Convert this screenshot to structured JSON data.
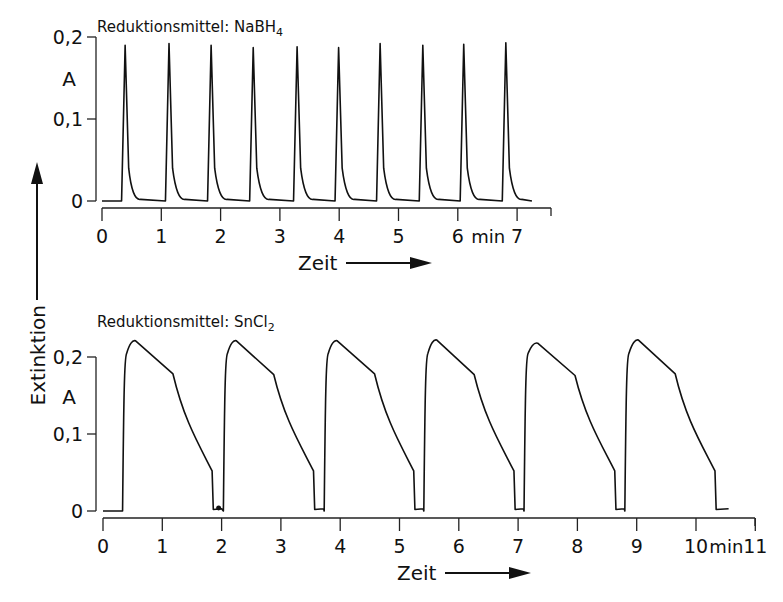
{
  "y_axis_shared_label": "Extinktion",
  "chart_data": [
    {
      "type": "line",
      "title": "Reduktionsmittel: NaBH",
      "title_subscript": "4",
      "xlabel": "Zeit",
      "x_unit": "min",
      "ylabel": "A",
      "x_ticks": [
        "0",
        "1",
        "2",
        "3",
        "4",
        "5",
        "6",
        "7"
      ],
      "y_ticks": [
        "0",
        "0,1",
        "0,2"
      ],
      "xlim": [
        0,
        7.3
      ],
      "ylim": [
        0,
        0.2
      ],
      "grid": false,
      "legend": null,
      "peak_shape": "sharp",
      "peaks": [
        {
          "t_start": 0.33,
          "t_peak": 0.39,
          "t_end": 0.55,
          "height": 0.19
        },
        {
          "t_start": 1.07,
          "t_peak": 1.13,
          "t_end": 1.3,
          "height": 0.192
        },
        {
          "t_start": 1.78,
          "t_peak": 1.84,
          "t_end": 2.01,
          "height": 0.19
        },
        {
          "t_start": 2.49,
          "t_peak": 2.55,
          "t_end": 2.72,
          "height": 0.187
        },
        {
          "t_start": 3.23,
          "t_peak": 3.29,
          "t_end": 3.46,
          "height": 0.188
        },
        {
          "t_start": 3.93,
          "t_peak": 3.99,
          "t_end": 4.16,
          "height": 0.187
        },
        {
          "t_start": 4.63,
          "t_peak": 4.69,
          "t_end": 4.86,
          "height": 0.192
        },
        {
          "t_start": 5.35,
          "t_peak": 5.41,
          "t_end": 5.58,
          "height": 0.19
        },
        {
          "t_start": 6.04,
          "t_peak": 6.1,
          "t_end": 6.27,
          "height": 0.191
        },
        {
          "t_start": 6.75,
          "t_peak": 6.81,
          "t_end": 6.98,
          "height": 0.193
        }
      ],
      "baseline": 0.0,
      "t_range": [
        0.0,
        7.25
      ]
    },
    {
      "type": "line",
      "title": "Reduktionsmittel: SnCl",
      "title_subscript": "2",
      "xlabel": "Zeit",
      "x_unit": "min",
      "ylabel": "A",
      "x_ticks": [
        "0",
        "1",
        "2",
        "3",
        "4",
        "5",
        "6",
        "7",
        "8",
        "9",
        "10",
        "11"
      ],
      "y_ticks": [
        "0",
        "0,1",
        "0,2"
      ],
      "xlim": [
        0,
        11
      ],
      "ylim": [
        0,
        0.2
      ],
      "grid": false,
      "legend": null,
      "peak_shape": "broad",
      "peaks": [
        {
          "t_start": 0.33,
          "t_max": 0.55,
          "height": 0.221,
          "t_shoulder": 1.18,
          "shoulder": 0.178,
          "t_drop": 1.84,
          "drop_from": 0.052,
          "t_end": 2.0
        },
        {
          "t_start": 2.03,
          "t_max": 2.25,
          "height": 0.221,
          "t_shoulder": 2.88,
          "shoulder": 0.177,
          "t_drop": 3.55,
          "drop_from": 0.052,
          "t_end": 3.72
        },
        {
          "t_start": 3.73,
          "t_max": 3.95,
          "height": 0.221,
          "t_shoulder": 4.58,
          "shoulder": 0.178,
          "t_drop": 5.24,
          "drop_from": 0.052,
          "t_end": 5.4
        },
        {
          "t_start": 5.41,
          "t_max": 5.63,
          "height": 0.222,
          "t_shoulder": 6.26,
          "shoulder": 0.177,
          "t_drop": 6.93,
          "drop_from": 0.052,
          "t_end": 7.09
        },
        {
          "t_start": 7.1,
          "t_max": 7.33,
          "height": 0.218,
          "t_shoulder": 7.96,
          "shoulder": 0.176,
          "t_drop": 8.63,
          "drop_from": 0.052,
          "t_end": 8.79
        },
        {
          "t_start": 8.8,
          "t_max": 9.03,
          "height": 0.222,
          "t_shoulder": 9.65,
          "shoulder": 0.178,
          "t_drop": 10.32,
          "drop_from": 0.052,
          "t_end": 10.55
        }
      ],
      "baseline": 0.0,
      "t_range": [
        0.0,
        10.55
      ]
    }
  ]
}
